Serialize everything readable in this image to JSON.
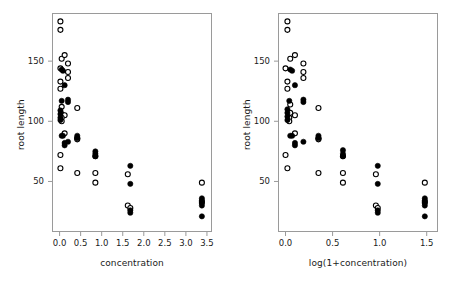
{
  "figure": {
    "background": "#ffffff",
    "marker_fill_color": "#000000",
    "marker_open_color": "#ffffff",
    "marker_stroke_color": "#000000",
    "frame_color": "#9a9a9a"
  },
  "chart_data": [
    {
      "type": "scatter",
      "panel": "left",
      "title": "",
      "xlabel": "concentration",
      "ylabel": "root length",
      "xlim": [
        -0.18,
        3.62
      ],
      "ylim": [
        8,
        190
      ],
      "xticks": [
        0.0,
        0.5,
        1.0,
        1.5,
        2.0,
        2.5,
        3.0,
        3.5
      ],
      "xticklabels": [
        "0.0",
        "0.5",
        "1.0",
        "1.5",
        "2.0",
        "2.5",
        "3.0",
        "3.5"
      ],
      "yticks": [
        50,
        100,
        150
      ],
      "yticklabels": [
        "50",
        "100",
        "150"
      ],
      "grid": false,
      "legend": "none",
      "series": [
        {
          "name": "open-circles",
          "marker": "open-circle",
          "points": [
            [
              0.02,
              183
            ],
            [
              0.02,
              176
            ],
            [
              0.05,
              152
            ],
            [
              0.12,
              155
            ],
            [
              0.2,
              148
            ],
            [
              0.02,
              144
            ],
            [
              0.2,
              141
            ],
            [
              0.2,
              136
            ],
            [
              0.02,
              133
            ],
            [
              0.02,
              127
            ],
            [
              0.05,
              112
            ],
            [
              0.05,
              106
            ],
            [
              0.12,
              105
            ],
            [
              0.42,
              111
            ],
            [
              0.05,
              103
            ],
            [
              0.05,
              100
            ],
            [
              0.12,
              90
            ],
            [
              0.42,
              86
            ],
            [
              0.42,
              85
            ],
            [
              0.02,
              72
            ],
            [
              0.85,
              71
            ],
            [
              0.02,
              61
            ],
            [
              0.42,
              57
            ],
            [
              0.85,
              57
            ],
            [
              0.85,
              49
            ],
            [
              1.62,
              56
            ],
            [
              1.62,
              30
            ],
            [
              1.68,
              28
            ],
            [
              3.38,
              49
            ],
            [
              3.38,
              33
            ]
          ]
        },
        {
          "name": "filled-circles",
          "marker": "filled-circle",
          "points": [
            [
              0.05,
              143
            ],
            [
              0.08,
              142
            ],
            [
              0.12,
              130
            ],
            [
              0.05,
              117
            ],
            [
              0.2,
              118
            ],
            [
              0.2,
              116
            ],
            [
              0.02,
              109
            ],
            [
              0.02,
              106
            ],
            [
              0.02,
              103
            ],
            [
              0.02,
              101
            ],
            [
              0.05,
              88
            ],
            [
              0.08,
              88
            ],
            [
              0.2,
              83
            ],
            [
              0.12,
              82
            ],
            [
              0.12,
              80
            ],
            [
              0.42,
              88
            ],
            [
              0.42,
              86
            ],
            [
              0.85,
              75
            ],
            [
              0.85,
              73
            ],
            [
              0.85,
              71
            ],
            [
              1.68,
              63
            ],
            [
              1.68,
              48
            ],
            [
              1.68,
              26
            ],
            [
              1.68,
              24
            ],
            [
              3.38,
              36
            ],
            [
              3.38,
              34
            ],
            [
              3.38,
              32
            ],
            [
              3.38,
              30
            ],
            [
              3.38,
              21
            ]
          ]
        }
      ]
    },
    {
      "type": "scatter",
      "panel": "right",
      "title": "",
      "xlabel": "log(1+concentration)",
      "ylabel": "root length",
      "xlim": [
        -0.08,
        1.62
      ],
      "ylim": [
        8,
        190
      ],
      "xticks": [
        0.0,
        0.5,
        1.0,
        1.5
      ],
      "xticklabels": [
        "0.0",
        "0.5",
        "1.0",
        "1.5"
      ],
      "yticks": [
        50,
        100,
        150
      ],
      "yticklabels": [
        "50",
        "100",
        "150"
      ],
      "grid": false,
      "legend": "none",
      "series": [
        {
          "name": "open-circles",
          "marker": "open-circle",
          "points": [
            [
              0.02,
              183
            ],
            [
              0.02,
              176
            ],
            [
              0.05,
              152
            ],
            [
              0.1,
              155
            ],
            [
              0.19,
              148
            ],
            [
              0.0,
              144
            ],
            [
              0.19,
              141
            ],
            [
              0.19,
              136
            ],
            [
              0.02,
              133
            ],
            [
              0.02,
              127
            ],
            [
              0.05,
              114
            ],
            [
              0.05,
              107
            ],
            [
              0.1,
              105
            ],
            [
              0.35,
              111
            ],
            [
              0.04,
              103
            ],
            [
              0.04,
              100
            ],
            [
              0.1,
              90
            ],
            [
              0.35,
              86
            ],
            [
              0.35,
              85
            ],
            [
              0.0,
              72
            ],
            [
              0.61,
              71
            ],
            [
              0.02,
              61
            ],
            [
              0.35,
              57
            ],
            [
              0.61,
              57
            ],
            [
              0.61,
              49
            ],
            [
              0.96,
              56
            ],
            [
              0.96,
              30
            ],
            [
              0.98,
              28
            ],
            [
              1.48,
              49
            ],
            [
              1.48,
              33
            ]
          ]
        },
        {
          "name": "filled-circles",
          "marker": "filled-circle",
          "points": [
            [
              0.05,
              143
            ],
            [
              0.07,
              142
            ],
            [
              0.1,
              130
            ],
            [
              0.04,
              117
            ],
            [
              0.19,
              118
            ],
            [
              0.19,
              116
            ],
            [
              0.02,
              110
            ],
            [
              0.02,
              107
            ],
            [
              0.02,
              104
            ],
            [
              0.02,
              101
            ],
            [
              0.05,
              88
            ],
            [
              0.07,
              88
            ],
            [
              0.19,
              83
            ],
            [
              0.1,
              82
            ],
            [
              0.1,
              80
            ],
            [
              0.35,
              88
            ],
            [
              0.35,
              86
            ],
            [
              0.61,
              76
            ],
            [
              0.61,
              73
            ],
            [
              0.61,
              71
            ],
            [
              0.98,
              63
            ],
            [
              0.98,
              48
            ],
            [
              0.98,
              26
            ],
            [
              0.98,
              24
            ],
            [
              1.48,
              36
            ],
            [
              1.48,
              34
            ],
            [
              1.48,
              32
            ],
            [
              1.48,
              30
            ],
            [
              1.48,
              21
            ]
          ]
        }
      ]
    }
  ]
}
